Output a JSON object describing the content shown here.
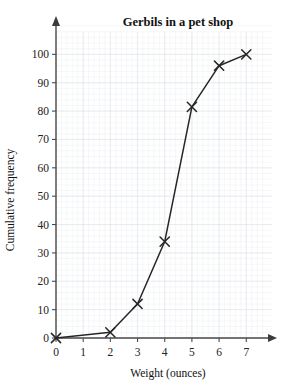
{
  "chart_data": {
    "type": "line",
    "title": "Gerbils in a pet shop",
    "xlabel": "Weight (ounces)",
    "ylabel": "Cumulative frequency",
    "x": [
      0,
      2,
      3,
      4,
      5,
      6,
      7
    ],
    "values": [
      0,
      2,
      12,
      34,
      81.5,
      96,
      100
    ],
    "series": [
      {
        "name": "Cumulative frequency",
        "x": [
          0,
          2,
          3,
          4,
          5,
          6,
          7
        ],
        "values": [
          0,
          2,
          12,
          34,
          81.5,
          96,
          100
        ]
      }
    ],
    "xlim": [
      0,
      7.8
    ],
    "ylim": [
      0,
      110
    ],
    "xticks": [
      0,
      1,
      2,
      3,
      4,
      5,
      6,
      7
    ],
    "yticks": [
      0,
      10,
      20,
      30,
      40,
      50,
      60,
      70,
      80,
      90,
      100
    ],
    "xtick_labels": [
      "0",
      "1",
      "2",
      "3",
      "4",
      "5",
      "6",
      "7"
    ],
    "ytick_labels": [
      "0",
      "10",
      "20",
      "30",
      "40",
      "50",
      "60",
      "70",
      "80",
      "90",
      "100"
    ],
    "grid": true,
    "grid_minor": true,
    "legend": false,
    "legend_position": "none",
    "marker": "x",
    "line_color": "#262626",
    "grid_color": "#eceef2",
    "axis_color": "#4a4a4a",
    "background": "#ffffff"
  },
  "axes": {
    "x_arrow": true,
    "y_arrow": true
  }
}
